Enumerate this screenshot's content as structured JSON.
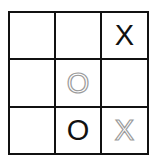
{
  "game": {
    "name": "tic-tac-toe",
    "board": [
      [
        {
          "mark": "",
          "style": "empty"
        },
        {
          "mark": "",
          "style": "empty"
        },
        {
          "mark": "X",
          "style": "solid"
        }
      ],
      [
        {
          "mark": "",
          "style": "empty"
        },
        {
          "mark": "O",
          "style": "ghost"
        },
        {
          "mark": "",
          "style": "empty"
        }
      ],
      [
        {
          "mark": "",
          "style": "empty"
        },
        {
          "mark": "O",
          "style": "solid"
        },
        {
          "mark": "X",
          "style": "ghost"
        }
      ]
    ],
    "colors": {
      "grid_line": "#111111",
      "solid_mark": "#111111",
      "ghost_mark_outline": "#9a9a9a",
      "background": "#ffffff"
    }
  }
}
